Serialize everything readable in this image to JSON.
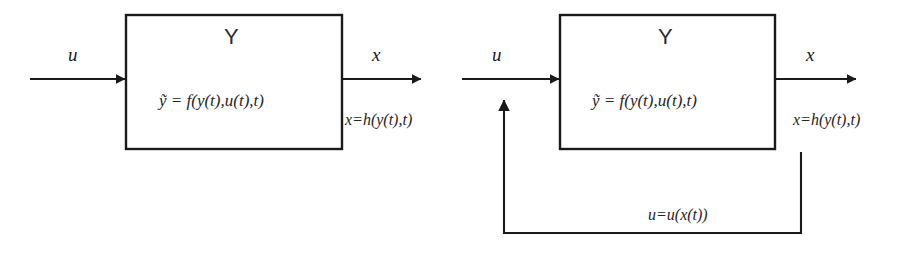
{
  "diagram": {
    "type": "block-diagram",
    "title_text": "",
    "stroke_color": "#1a1a1a",
    "background_color": "#ffffff",
    "blocks": [
      {
        "id": "open-loop",
        "system_label": "Y",
        "state_equation": "ỹ = f(y(t),u(t),t)",
        "input_label": "u",
        "output_label": "x",
        "output_equation": "x=h(y(t),t)"
      },
      {
        "id": "closed-loop",
        "system_label": "Y",
        "state_equation": "ỹ = f(y(t),u(t),t)",
        "input_label": "u",
        "output_label": "x",
        "output_equation": "x=h(y(t),t)",
        "feedback_equation": "u=u(x(t))"
      }
    ]
  }
}
